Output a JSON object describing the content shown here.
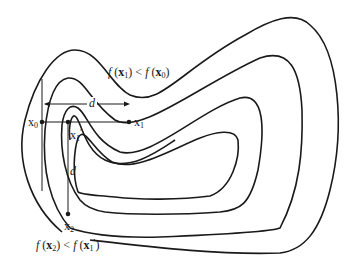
{
  "figure": {
    "type": "contour-diagram",
    "colors": {
      "stroke": "#1a1a1a",
      "background": "#ffffff"
    }
  },
  "labels": {
    "f_x1_lt_f_x0": "f (x1) < f (x0)",
    "f_x2_lt_f_x1p": "f (x2) < f (x1')",
    "x0": "x0",
    "x1": "x1",
    "x1_prime": "x1'",
    "x2": "x2",
    "d_horizontal": "d",
    "d_vertical": "d"
  },
  "annotations": {
    "top_f": "f",
    "top_x1": "x",
    "top_x1_sub": "1",
    "top_lt": "<",
    "top_x0": "x",
    "top_x0_sub": "0",
    "bot_f": "f",
    "bot_x2": "x",
    "bot_x2_sub": "2",
    "bot_lt": "<",
    "bot_x1p": "x",
    "bot_x1p_sub": "1",
    "bot_prime": "′",
    "pt_x0": "x",
    "pt_x0_sub": "0",
    "pt_x1": "x",
    "pt_x1_sub": "1",
    "pt_x1p": "x",
    "pt_x1p_sub": "1",
    "pt_x1p_prime": "′",
    "pt_x2": "x",
    "pt_x2_sub": "2",
    "d": "d"
  }
}
